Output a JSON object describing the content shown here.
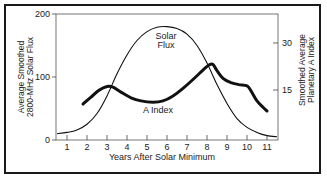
{
  "chart_data": {
    "type": "line",
    "title": "",
    "xlabel": "Years After Solar Minimum",
    "ylabel_left": "Average Smoothed 2800-MHz Solar Flux",
    "ylabel_right": "Smoothed Average Planetary A Index",
    "x_ticks": [
      "1",
      "2",
      "3",
      "4",
      "5",
      "6",
      "7",
      "8",
      "9",
      "10",
      "11"
    ],
    "y_left_ticks": [
      "0",
      "100",
      "200"
    ],
    "y_right_ticks": [
      "15",
      "30"
    ],
    "xlim": [
      0.5,
      11.5
    ],
    "ylim_left": [
      0,
      200
    ],
    "grid": false,
    "series": [
      {
        "name": "Solar Flux",
        "axis": "left",
        "x": [
          0.5,
          1,
          1.5,
          2,
          2.5,
          3,
          3.5,
          4,
          4.5,
          5,
          5.5,
          6,
          6.5,
          7,
          7.5,
          8,
          8.5,
          9,
          9.5,
          10,
          10.5,
          11,
          11.5
        ],
        "values": [
          10,
          12,
          16,
          25,
          42,
          70,
          105,
          135,
          158,
          172,
          179,
          180,
          177,
          168,
          150,
          122,
          88,
          58,
          34,
          20,
          12,
          7,
          5
        ]
      },
      {
        "name": "A Index",
        "axis": "left-scale",
        "x": [
          1.8,
          2.2,
          2.6,
          3.0,
          3.3,
          3.7,
          4.2,
          4.7,
          5.3,
          5.8,
          6.3,
          6.8,
          7.3,
          7.8,
          8.1,
          8.3,
          8.5,
          8.8,
          9.2,
          9.6,
          10.0,
          10.2,
          10.5,
          10.8,
          11.0
        ],
        "values": [
          57,
          68,
          79,
          85,
          84,
          76,
          67,
          62,
          60,
          62,
          70,
          82,
          96,
          111,
          119,
          120,
          110,
          98,
          91,
          88,
          86,
          78,
          62,
          52,
          46
        ]
      }
    ],
    "annotations": [
      {
        "text_line1": "Solar",
        "text_line2": "Flux"
      },
      {
        "text": "A Index"
      }
    ]
  }
}
